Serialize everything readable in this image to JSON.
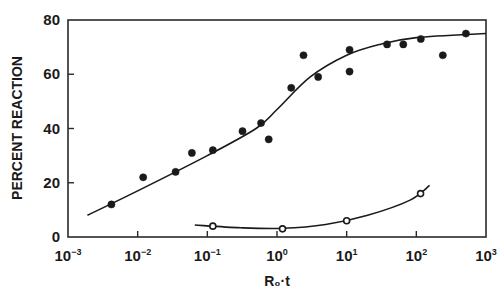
{
  "chart_data": {
    "type": "scatter",
    "title": "",
    "xlabel": "R₀·t",
    "ylabel": "PERCENT REACTION",
    "xscale": "log",
    "xlim": [
      0.001,
      1000
    ],
    "ylim": [
      0,
      80
    ],
    "grid": false,
    "legend": null,
    "x_tick_labels": [
      {
        "base": "10",
        "exp": "−3",
        "value": 0.001
      },
      {
        "base": "10",
        "exp": "−2",
        "value": 0.01
      },
      {
        "base": "10",
        "exp": "−1",
        "value": 0.1
      },
      {
        "base": "10",
        "exp": "0",
        "value": 1
      },
      {
        "base": "10",
        "exp": "1",
        "value": 10
      },
      {
        "base": "10",
        "exp": "2",
        "value": 100
      },
      {
        "base": "10",
        "exp": "3",
        "value": 1000
      }
    ],
    "y_tick_labels": [
      "0",
      "20",
      "40",
      "60",
      "80"
    ],
    "y_ticks": [
      0,
      20,
      40,
      60,
      80
    ],
    "series": [
      {
        "name": "filled circles",
        "marker": "filled-circle",
        "points": [
          {
            "x": 0.0042,
            "y": 12
          },
          {
            "x": 0.012,
            "y": 22
          },
          {
            "x": 0.035,
            "y": 24
          },
          {
            "x": 0.06,
            "y": 31
          },
          {
            "x": 0.12,
            "y": 32
          },
          {
            "x": 0.32,
            "y": 39
          },
          {
            "x": 0.59,
            "y": 42
          },
          {
            "x": 0.76,
            "y": 36
          },
          {
            "x": 1.6,
            "y": 55
          },
          {
            "x": 2.4,
            "y": 67
          },
          {
            "x": 3.9,
            "y": 59
          },
          {
            "x": 11,
            "y": 69
          },
          {
            "x": 11,
            "y": 61
          },
          {
            "x": 38,
            "y": 71
          },
          {
            "x": 65,
            "y": 71
          },
          {
            "x": 116,
            "y": 73
          },
          {
            "x": 240,
            "y": 67
          },
          {
            "x": 515,
            "y": 75
          }
        ],
        "fit_curve": [
          {
            "x": 0.0019,
            "y": 8
          },
          {
            "x": 0.01,
            "y": 17
          },
          {
            "x": 0.1,
            "y": 30
          },
          {
            "x": 0.5,
            "y": 40
          },
          {
            "x": 1,
            "y": 47
          },
          {
            "x": 3,
            "y": 59
          },
          {
            "x": 10,
            "y": 67
          },
          {
            "x": 30,
            "y": 71
          },
          {
            "x": 100,
            "y": 73.5
          },
          {
            "x": 1000,
            "y": 75
          }
        ]
      },
      {
        "name": "open circles",
        "marker": "open-circle",
        "points": [
          {
            "x": 0.12,
            "y": 4
          },
          {
            "x": 1.2,
            "y": 3
          },
          {
            "x": 10,
            "y": 6
          },
          {
            "x": 115,
            "y": 16
          }
        ],
        "fit_curve": [
          {
            "x": 0.066,
            "y": 4.4
          },
          {
            "x": 0.3,
            "y": 3.4
          },
          {
            "x": 1.2,
            "y": 3.2
          },
          {
            "x": 5,
            "y": 4.6
          },
          {
            "x": 20,
            "y": 8
          },
          {
            "x": 80,
            "y": 13.5
          },
          {
            "x": 155,
            "y": 19
          }
        ]
      }
    ]
  }
}
